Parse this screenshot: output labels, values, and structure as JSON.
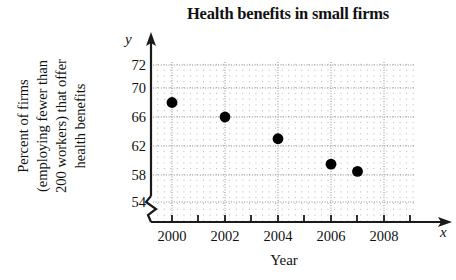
{
  "chart_data": {
    "type": "scatter",
    "title": "Health benefits in small firms",
    "xlabel": "Year",
    "ylabel": "Percent of firms (employing fewer than 200 workers) that offer health benefits",
    "ylabel_lines": [
      "Percent of firms",
      "(employing fewer than",
      "200 workers) that offer",
      "health benefits"
    ],
    "x_axis_letter": "x",
    "y_axis_letter": "y",
    "x": [
      2000,
      2002,
      2004,
      2006,
      2007
    ],
    "values": [
      68,
      66,
      63,
      59.5,
      58.5
    ],
    "points": [
      {
        "x": 2000,
        "y": 68
      },
      {
        "x": 2002,
        "y": 66
      },
      {
        "x": 2004,
        "y": 63
      },
      {
        "x": 2006,
        "y": 59.5
      },
      {
        "x": 2007,
        "y": 58.5
      }
    ],
    "xticks": [
      2000,
      2002,
      2004,
      2006,
      2008
    ],
    "xtick_labels": [
      "2000",
      "2002",
      "2004",
      "2006",
      "2008"
    ],
    "yticks": [
      54,
      58,
      62,
      66,
      70,
      72
    ],
    "ytick_labels": [
      "72",
      "70",
      "66",
      "62",
      "58",
      "54"
    ],
    "xlim": [
      1999,
      2009
    ],
    "ylim": [
      52,
      73
    ],
    "grid": true,
    "legend": "none",
    "axis_break": "y-axis below 54",
    "marker": "filled-circle",
    "marker_color": "#000000",
    "grid_color": "#b9b9b9",
    "axis_color": "#1a1a1a"
  }
}
